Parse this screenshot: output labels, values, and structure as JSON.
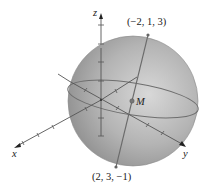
{
  "figure": {
    "type": "sphere-diagram"
  },
  "axes": {
    "x_label": "x",
    "y_label": "y",
    "z_label": "z"
  },
  "points": {
    "top": {
      "label": "(−2, 1, 3)"
    },
    "bottom": {
      "label": "(2, 3, −1)"
    },
    "center": {
      "label": "M"
    }
  },
  "colors": {
    "sphere_light": "#d4d4d4",
    "sphere_dark": "#8c8c8c",
    "line": "#555555",
    "axis": "#333333"
  }
}
